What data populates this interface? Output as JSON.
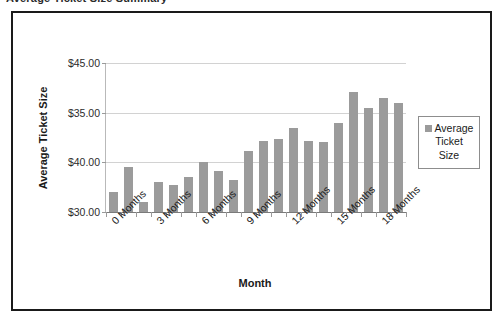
{
  "scan": {
    "clipped_top_text": "Average Ticket Size Summary"
  },
  "chart_data": {
    "type": "bar",
    "title": "",
    "xlabel": "Month",
    "ylabel": "Average Ticket Size",
    "ylim": [
      30,
      45
    ],
    "ytick_values": [
      30,
      40,
      35,
      45
    ],
    "ytick_labels": [
      "$30.00",
      "$35.00",
      "$40.00",
      "$45.00"
    ],
    "grid": true,
    "legend_position": "right",
    "series": [
      {
        "name": "Average Ticket Size",
        "color": "#9b9b9b",
        "values": [
          32.0,
          34.5,
          31.0,
          33.0,
          32.7,
          33.5,
          35.0,
          34.1,
          33.2,
          36.1,
          37.1,
          37.4,
          38.5,
          37.1,
          37.0,
          39.0,
          42.1,
          40.5,
          41.5,
          41.0
        ]
      }
    ],
    "x": [
      0,
      1,
      2,
      3,
      4,
      5,
      6,
      7,
      8,
      9,
      10,
      11,
      12,
      13,
      14,
      15,
      16,
      17,
      18,
      19
    ],
    "categories": [
      "0 Months",
      "",
      "",
      "3 Months",
      "",
      "",
      "6 Months",
      "",
      "",
      "9 Months",
      "",
      "",
      "12 Months",
      "",
      "",
      "15 Months",
      "",
      "",
      "18 Months",
      ""
    ],
    "visible_category_labels": [
      {
        "index": 0,
        "label": "0 Months"
      },
      {
        "index": 3,
        "label": "3 Months"
      },
      {
        "index": 6,
        "label": "6 Months"
      },
      {
        "index": 9,
        "label": "9 Months"
      },
      {
        "index": 12,
        "label": "12 Months"
      },
      {
        "index": 15,
        "label": "15 Months"
      },
      {
        "index": 18,
        "label": "18 Months"
      }
    ]
  },
  "legend": {
    "marker_icon": "legend-square-swatch",
    "label_line_1": "Average",
    "label_line_2": "Ticket",
    "label_line_3": "Size"
  }
}
